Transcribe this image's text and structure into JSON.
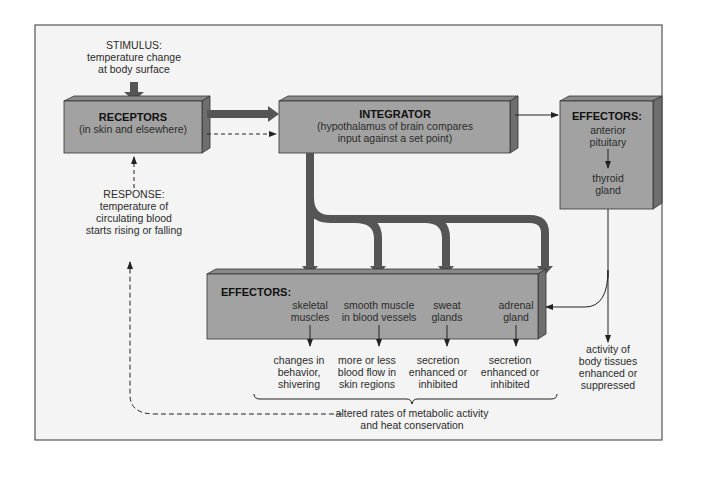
{
  "diagram": {
    "colors": {
      "frame_bg": "#f3f3f3",
      "box_front": "#a2a2a2",
      "box_top": "#8a8a8a",
      "box_side": "#6e6e6e",
      "arrow": "#555555",
      "line": "#222222"
    },
    "stimulus": {
      "line1": "STIMULUS:",
      "line2": "temperature change",
      "line3": "at body surface"
    },
    "receptors": {
      "title": "RECEPTORS",
      "sub": "(in skin and elsewhere)"
    },
    "integrator": {
      "title": "INTEGRATOR",
      "line1": "(hypothalamus of brain compares",
      "line2": "input against a set point)"
    },
    "effectors_right": {
      "title": "EFFECTORS:",
      "line1": "anterior",
      "line2": "pituitary",
      "line3": "thyroid",
      "line4": "gland"
    },
    "response": {
      "line1": "RESPONSE:",
      "line2": "temperature of",
      "line3": "circulating blood",
      "line4": "starts rising or falling"
    },
    "effectors_bottom": {
      "title": "EFFECTORS:",
      "items": [
        {
          "line1": "skeletal",
          "line2": "muscles"
        },
        {
          "line1": "smooth muscle",
          "line2": "in blood vessels"
        },
        {
          "line1": "sweat",
          "line2": "glands"
        },
        {
          "line1": "adrenal",
          "line2": "gland"
        }
      ]
    },
    "outcomes": [
      {
        "line1": "changes in",
        "line2": "behavior,",
        "line3": "shivering"
      },
      {
        "line1": "more or less",
        "line2": "blood flow in",
        "line3": "skin regions"
      },
      {
        "line1": "secretion",
        "line2": "enhanced or",
        "line3": "inhibited"
      },
      {
        "line1": "secretion",
        "line2": "enhanced or",
        "line3": "inhibited"
      },
      {
        "line1": "activity of",
        "line2": "body tissues",
        "line3": "enhanced or",
        "line4": "suppressed"
      }
    ],
    "summary": {
      "line1": "altered rates of metabolic activity",
      "line2": "and heat conservation"
    }
  }
}
